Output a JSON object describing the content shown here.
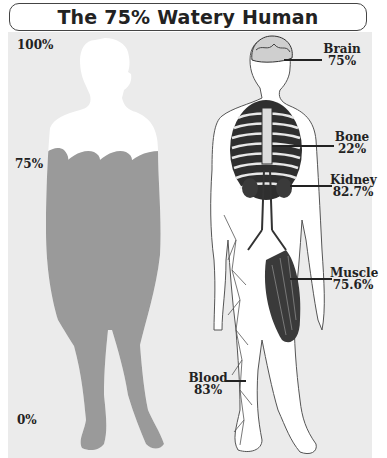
{
  "title": "The 75% Watery Human",
  "scale": {
    "top": "100%",
    "middle": "75%",
    "bottom": "0%"
  },
  "silhouette": {
    "water_level_pct": 75,
    "water_color": "#9a9a9a",
    "body_color": "#ffffff"
  },
  "organs": [
    {
      "name": "Brain",
      "value": "75%"
    },
    {
      "name": "Bone",
      "value": "22%"
    },
    {
      "name": "Kidney",
      "value": "82.7%"
    },
    {
      "name": "Muscle",
      "value": "75.6%"
    },
    {
      "name": "Blood",
      "value": "83%"
    }
  ],
  "colors": {
    "panel": "#ebebeb",
    "text": "#222222",
    "ink": "#2a2a2a"
  }
}
